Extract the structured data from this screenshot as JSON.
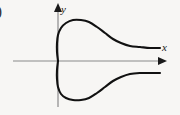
{
  "figure": {
    "tag_label": ")",
    "background_color": "#f7f6f4",
    "curve_color": "#111111",
    "axis_color": "#8a8a8a",
    "arrow_color": "#1a1a1a",
    "curve_stroke_width": 2.1,
    "axis_stroke_width": 1.2
  },
  "axes": {
    "x": {
      "label": "x",
      "origin_x": 58,
      "origin_y": 61,
      "start_x": 13,
      "end_x": 160,
      "arrow_name": "x-axis-arrowhead"
    },
    "y": {
      "label": "y",
      "origin_x": 58,
      "top_y": 8,
      "bottom_y": 107,
      "arrow_name": "y-axis-arrowhead"
    }
  },
  "chart_data": {
    "type": "line",
    "title": "",
    "xlabel": "x",
    "ylabel": "y",
    "grid": false,
    "legend": null,
    "node_point": {
      "x": 0,
      "y": 0
    },
    "series": [
      {
        "name": "upper-branch",
        "points_px": [
          [
            58,
            61
          ],
          [
            57,
            52
          ],
          [
            57,
            43
          ],
          [
            58,
            35
          ],
          [
            61,
            28
          ],
          [
            66,
            23
          ],
          [
            73,
            20
          ],
          [
            81,
            20
          ],
          [
            89,
            22
          ],
          [
            97,
            27
          ],
          [
            105,
            33
          ],
          [
            113,
            39
          ],
          [
            121,
            43
          ],
          [
            130,
            46
          ],
          [
            140,
            47
          ],
          [
            150,
            48
          ],
          [
            160,
            48
          ]
        ],
        "peak_px": [
          83,
          20
        ],
        "asymptote_y_px": 48
      },
      {
        "name": "lower-branch",
        "points_px": [
          [
            58,
            61
          ],
          [
            57,
            70
          ],
          [
            57,
            79
          ],
          [
            58,
            87
          ],
          [
            61,
            94
          ],
          [
            66,
            98
          ],
          [
            73,
            100
          ],
          [
            81,
            100
          ],
          [
            89,
            98
          ],
          [
            97,
            93
          ],
          [
            105,
            87
          ],
          [
            113,
            81
          ],
          [
            121,
            77
          ],
          [
            130,
            74
          ],
          [
            140,
            73
          ],
          [
            150,
            73
          ],
          [
            160,
            73
          ]
        ],
        "trough_px": [
          83,
          100
        ],
        "asymptote_y_px": 73
      }
    ]
  }
}
